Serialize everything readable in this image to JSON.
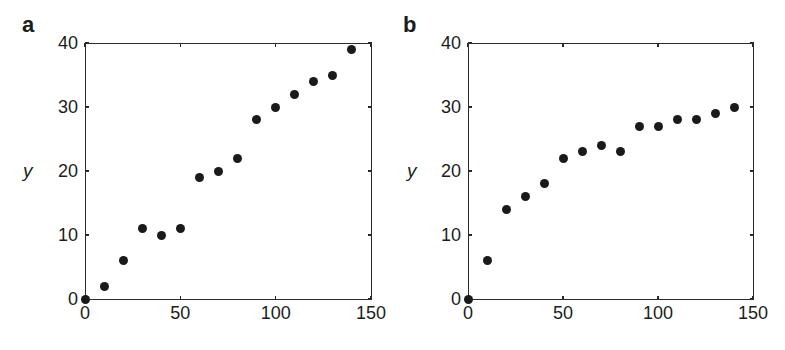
{
  "chart_data": [
    {
      "type": "scatter",
      "panel_label": "a",
      "title": "",
      "xlabel": "",
      "ylabel": "y",
      "xlim": [
        0,
        150
      ],
      "ylim": [
        0,
        40
      ],
      "xticks": [
        0,
        50,
        100,
        150
      ],
      "yticks": [
        0,
        10,
        20,
        30,
        40
      ],
      "grid": false,
      "series": [
        {
          "name": "data",
          "x": [
            0,
            10,
            20,
            30,
            40,
            50,
            60,
            70,
            80,
            90,
            100,
            110,
            120,
            130,
            140
          ],
          "y": [
            0,
            2,
            6,
            11,
            10,
            11,
            19,
            20,
            22,
            28,
            30,
            32,
            34,
            35,
            39
          ]
        }
      ]
    },
    {
      "type": "scatter",
      "panel_label": "b",
      "title": "",
      "xlabel": "",
      "ylabel": "y",
      "xlim": [
        0,
        150
      ],
      "ylim": [
        0,
        40
      ],
      "xticks": [
        0,
        50,
        100,
        150
      ],
      "yticks": [
        0,
        10,
        20,
        30,
        40
      ],
      "grid": false,
      "series": [
        {
          "name": "data",
          "x": [
            0,
            10,
            20,
            30,
            40,
            50,
            60,
            70,
            80,
            90,
            100,
            110,
            120,
            130,
            140
          ],
          "y": [
            0,
            6,
            14,
            16,
            18,
            22,
            23,
            24,
            23,
            27,
            27,
            28,
            28,
            29,
            30
          ]
        }
      ]
    }
  ],
  "colors": {
    "point": "#1a1a1a",
    "axis": "#2a2a2a",
    "background": "#ffffff"
  }
}
